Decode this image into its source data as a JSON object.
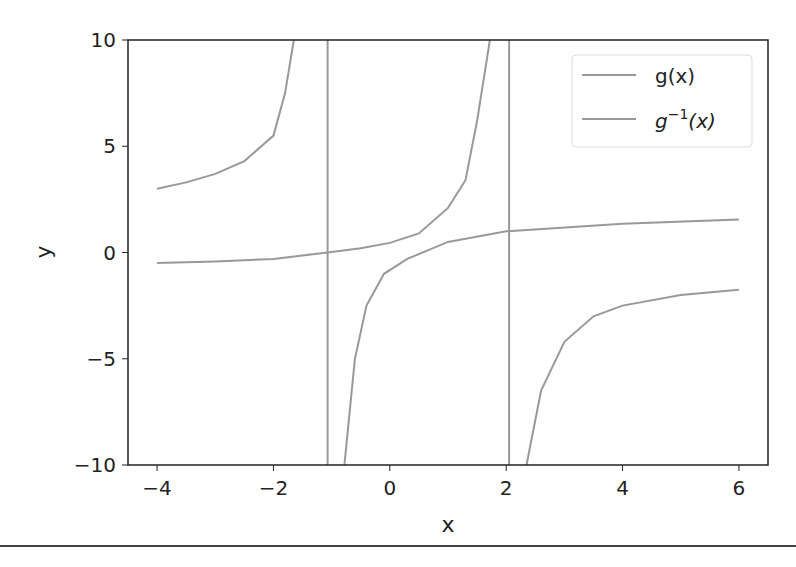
{
  "chart_data": {
    "type": "line",
    "title": "",
    "xlabel": "x",
    "ylabel": "y",
    "xlim": [
      -4.5,
      6.5
    ],
    "ylim": [
      -10,
      10
    ],
    "xticks": [
      -4,
      -2,
      0,
      2,
      4,
      6
    ],
    "xtick_labels": [
      "−4",
      "−2",
      "0",
      "2",
      "4",
      "6"
    ],
    "yticks": [
      10,
      5,
      0,
      -5,
      -10
    ],
    "ytick_labels": [
      "10",
      "5",
      "0",
      "−5",
      "−10"
    ],
    "grid": false,
    "legend_position": "upper right",
    "series": [
      {
        "name": "g(x)",
        "color": "#999999",
        "segments": [
          [
            [
              -4,
              3.0
            ],
            [
              -3.5,
              3.3
            ],
            [
              -3,
              3.7
            ],
            [
              -2.5,
              4.3
            ],
            [
              -2,
              5.5
            ],
            [
              -1.8,
              7.5
            ],
            [
              -1.65,
              10
            ]
          ],
          [
            [
              -1.07,
              10
            ],
            [
              -1.07,
              -10
            ]
          ],
          [
            [
              -0.78,
              -10
            ],
            [
              -0.6,
              -5
            ],
            [
              -0.4,
              -2.5
            ],
            [
              -0.1,
              -1.0
            ],
            [
              0.3,
              -0.3
            ],
            [
              1,
              0.5
            ],
            [
              2,
              1.0
            ],
            [
              4,
              1.35
            ],
            [
              6,
              1.55
            ]
          ]
        ]
      },
      {
        "name": "g^-1(x)",
        "color": "#999999",
        "segments": [
          [
            [
              -4,
              -0.5
            ],
            [
              -3,
              -0.42
            ],
            [
              -2,
              -0.3
            ],
            [
              -1.07,
              0
            ],
            [
              -0.5,
              0.2
            ],
            [
              0,
              0.45
            ],
            [
              0.5,
              0.9
            ],
            [
              1,
              2.1
            ],
            [
              1.3,
              3.4
            ],
            [
              1.5,
              6.2
            ],
            [
              1.72,
              10
            ]
          ],
          [
            [
              2.05,
              10
            ],
            [
              2.05,
              -10
            ]
          ],
          [
            [
              2.35,
              -10
            ],
            [
              2.6,
              -6.5
            ],
            [
              3,
              -4.2
            ],
            [
              3.5,
              -3.0
            ],
            [
              4,
              -2.5
            ],
            [
              5,
              -2.0
            ],
            [
              6,
              -1.75
            ]
          ]
        ]
      }
    ],
    "legend": [
      "g(x)",
      "g⁻¹(x)"
    ]
  },
  "legend": {
    "item1": "g(x)",
    "item2_base": "g",
    "item2_sup": "−1",
    "item2_arg": "(x)"
  }
}
